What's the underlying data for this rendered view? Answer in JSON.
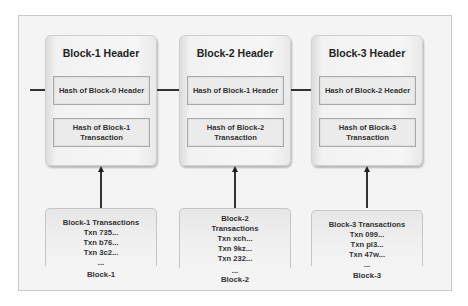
{
  "diagram": {
    "blocks": [
      {
        "header_title": "Block-1 Header",
        "prev_hash": "Hash of Block-0 Header",
        "tx_hash": "Hash of Block-1 Transaction",
        "transactions_title": "Block-1 Transactions",
        "transactions": [
          "Txn 735...",
          "Txn b76...",
          "Txn 3c2...",
          "..."
        ],
        "label": "Block-1"
      },
      {
        "header_title": "Block-2 Header",
        "prev_hash": "Hash of Block-1 Header",
        "tx_hash": "Hash of Block-2 Transaction",
        "transactions_title": "Block-2 Transactions",
        "transactions": [
          "Txn xch...",
          "Txn 9kz...",
          "Txn 232...",
          "..."
        ],
        "label": "Block-2"
      },
      {
        "header_title": "Block-3 Header",
        "prev_hash": "Hash of Block-2 Header",
        "tx_hash": "Hash of Block-3 Transaction",
        "transactions_title": "Block-3 Transactions",
        "transactions": [
          "Txn 099...",
          "Txn pl3...",
          "Txn 47w...",
          "..."
        ],
        "label": "Block-3"
      }
    ]
  }
}
